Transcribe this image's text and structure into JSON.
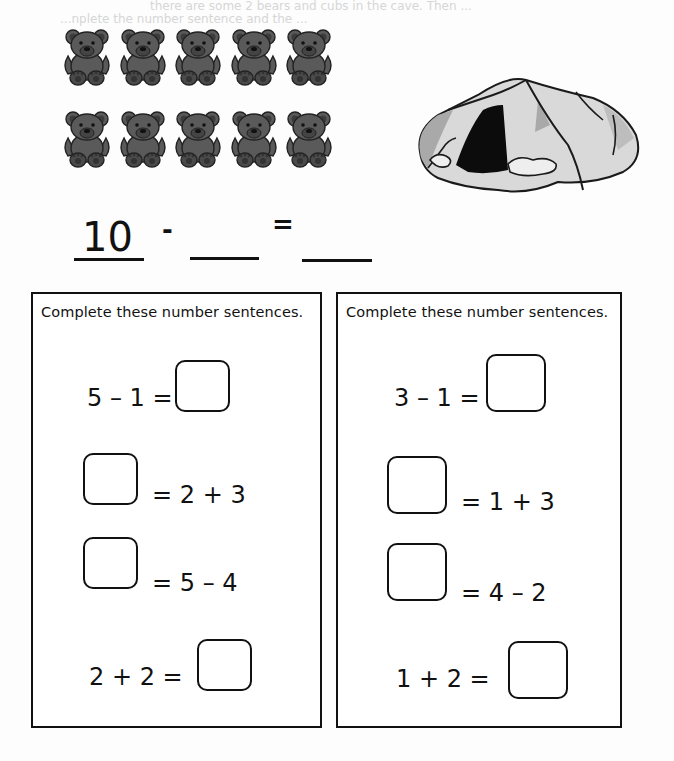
{
  "page": {
    "bleed_through_text": [
      "there are some 2 bears and cubs in the cave. Then ... ",
      "     ...nplete the number sentence and the ..."
    ]
  },
  "illustration": {
    "bears": {
      "count": 10,
      "rows": 2,
      "per_row": 5,
      "icon": "teddy-bear-icon",
      "fill": "#5a5a5a",
      "outline": "#222222"
    },
    "cave": {
      "icon": "cave-icon",
      "fill": "#d9d9d9",
      "shadow": "#a9a9a9",
      "opening": "#0c0c0c"
    }
  },
  "main_equation": {
    "start": "10",
    "operator": "-",
    "equals": "=",
    "blank_2": "",
    "blank_3": ""
  },
  "panels": [
    {
      "title": "Complete these number sentences.",
      "rows": [
        {
          "left": "5 – 1 =",
          "right": "",
          "box_position": "after"
        },
        {
          "left": "",
          "right": "= 2 + 3",
          "box_position": "before"
        },
        {
          "left": "",
          "right": "= 5 – 4",
          "box_position": "before"
        },
        {
          "left": "2 + 2 =",
          "right": "",
          "box_position": "after"
        }
      ]
    },
    {
      "title": "Complete these number sentences.",
      "rows": [
        {
          "left": "3 – 1 =",
          "right": "",
          "box_position": "after"
        },
        {
          "left": "",
          "right": "= 1 + 3",
          "box_position": "before"
        },
        {
          "left": "",
          "right": "= 4 – 2",
          "box_position": "before"
        },
        {
          "left": "1 + 2 =",
          "right": "",
          "box_position": "after"
        }
      ]
    }
  ]
}
